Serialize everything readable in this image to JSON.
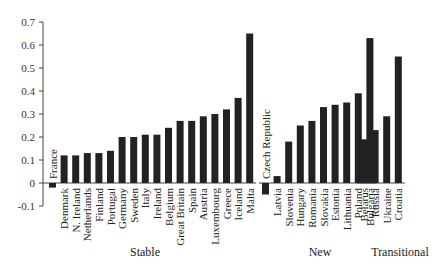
{
  "chart_data": {
    "type": "bar",
    "title": "",
    "xlabel": "",
    "ylabel": "",
    "ylim": [
      -0.1,
      0.7
    ],
    "yticks": [
      -0.1,
      0,
      0.1,
      0.2,
      0.3,
      0.4,
      0.5,
      0.6,
      0.7
    ],
    "ytick_labels": [
      "-0.1",
      "0",
      "0.1",
      "0.2",
      "0.3",
      "0.4",
      "0.5",
      "0.6",
      "0.7"
    ],
    "grid": false,
    "legend": null,
    "bar_color": "#222222",
    "groups": [
      {
        "name": "Stable",
        "categories": [
          "France",
          "Denmark",
          "N. Ireland",
          "Netherlands",
          "Finland",
          "Portugal",
          "Germany",
          "Sweden",
          "Italy",
          "Ireland",
          "Belgium",
          "Great Britain",
          "Spain",
          "Austria",
          "Luxembourg",
          "Greece",
          "Iceland",
          "Malta"
        ],
        "values": [
          -0.02,
          0.12,
          0.12,
          0.13,
          0.13,
          0.14,
          0.2,
          0.2,
          0.21,
          0.21,
          0.24,
          0.27,
          0.27,
          0.29,
          0.3,
          0.32,
          0.37,
          0.65
        ]
      },
      {
        "name": "New",
        "categories": [
          "Czech Republic",
          "Latvia",
          "Slovenia",
          "Hungary",
          "Romania",
          "Slovakia",
          "Estonia",
          "Lithuania",
          "Poland",
          "Bulgaria"
        ],
        "values": [
          -0.05,
          0.03,
          0.18,
          0.25,
          0.27,
          0.33,
          0.34,
          0.35,
          0.39,
          0.63
        ]
      },
      {
        "name": "Transitional",
        "categories": [
          "Belarus",
          "Russia",
          "Ukraine",
          "Croatia"
        ],
        "values": [
          0.19,
          0.23,
          0.29,
          0.55
        ]
      }
    ]
  }
}
